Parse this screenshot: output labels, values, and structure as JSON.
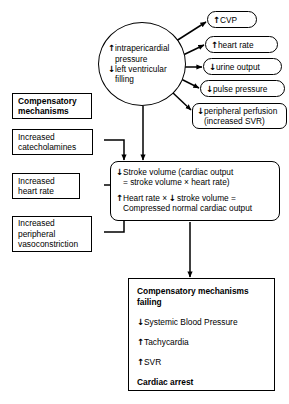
{
  "diagram": {
    "stroke_color": "#000000",
    "background_color": "#ffffff"
  },
  "central_node": {
    "name": "intrapericardial-pressure-ellipse",
    "lines": [
      {
        "arrow": "↑",
        "text": "intrapericardial"
      },
      {
        "arrow": "",
        "text": "pressure"
      },
      {
        "arrow": "↓",
        "text": "left ventricular"
      },
      {
        "arrow": "",
        "text": "filling"
      }
    ]
  },
  "effects": [
    {
      "id": "cvp",
      "arrow": "↑",
      "text": "CVP"
    },
    {
      "id": "heart-rate",
      "arrow": "↑",
      "text": "heart rate"
    },
    {
      "id": "urine-output",
      "arrow": "↓",
      "text": "urine output"
    },
    {
      "id": "pulse-pressure",
      "arrow": "↓",
      "text": "pulse pressure"
    },
    {
      "id": "peripheral-perfusion",
      "arrow": "↓",
      "text": "peripheral perfusion",
      "text2": "(increased SVR)"
    }
  ],
  "compensatory_header": {
    "line1": "Compensatory",
    "line2": "mechanisms"
  },
  "compensatory_items": [
    {
      "id": "catecholamines",
      "line1": "Increased",
      "line2": "catecholamines",
      "line3": ""
    },
    {
      "id": "heart-rate",
      "line1": "Increased",
      "line2": "heart rate",
      "line3": ""
    },
    {
      "id": "vasoconstriction",
      "line1": "Increased",
      "line2": "peripheral",
      "line3": "vasoconstriction"
    }
  ],
  "equation_box": {
    "group1": [
      {
        "arrow": "↓",
        "text": "Stroke volume (cardiac output"
      },
      {
        "arrow": "",
        "text": "= stroke volume × heart rate)"
      }
    ],
    "group2_prefix_arrow": "↑",
    "group2_prefix_text": "Heart rate ×",
    "group2_mid_arrow": "↓",
    "group2_mid_text": "stroke volume =",
    "group2_line2": "Compressed normal cardiac output"
  },
  "outcome_box": {
    "heading_line1": "Compensatory mechanisms",
    "heading_line2": "failing",
    "items": [
      {
        "arrow": "↓",
        "text": "Systemic Blood Pressure"
      },
      {
        "arrow": "↑",
        "text": "Tachycardia"
      },
      {
        "arrow": "↑",
        "text": "SVR"
      }
    ],
    "footer": "Cardiac arrest"
  }
}
